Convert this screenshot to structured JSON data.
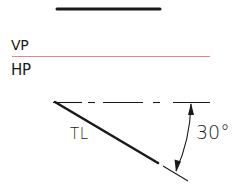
{
  "diagram": {
    "labels": {
      "vertical_plane": "VP",
      "horizontal_plane": "HP",
      "true_length": "TL",
      "angle": "30°"
    },
    "colors": {
      "ink": "#1a1a1a",
      "reference_line": "#e8808f",
      "background": "#ffffff"
    },
    "elements": {
      "front_view_line": {
        "x1": 57,
        "y1": 9,
        "x2": 160,
        "y2": 9,
        "stroke_width": 3
      },
      "xy_reference_line": {
        "x1": 12,
        "y1": 56,
        "x2": 210,
        "y2": 56
      },
      "horizontal_center_line": {
        "x1": 53,
        "y1": 102,
        "x2": 210,
        "y2": 102,
        "style": "dash-dot"
      },
      "true_length_line": {
        "x1": 55,
        "y1": 102,
        "x2": 158,
        "y2": 163,
        "stroke_width": 2.5
      },
      "extension_line": {
        "x1": 163,
        "y1": 166,
        "x2": 188,
        "y2": 181
      },
      "angle_dimension": {
        "value_deg": 30,
        "arc_start": [
          191,
          103
        ],
        "arc_end": [
          176,
          172
        ]
      }
    }
  }
}
